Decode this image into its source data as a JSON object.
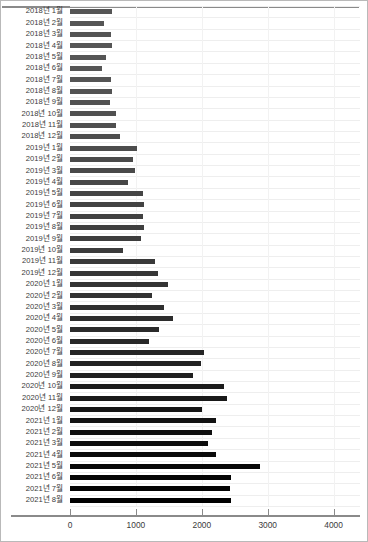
{
  "chart_data": {
    "type": "bar",
    "orientation": "horizontal",
    "title": "",
    "subtitle": "",
    "xlabel": "",
    "ylabel": "",
    "xlim": [
      0,
      4400
    ],
    "ylim": null,
    "grid": true,
    "legend": null,
    "legend_position": "none",
    "xticks": [
      0,
      1000,
      2000,
      3000,
      4000
    ],
    "xticklabels": [
      "0",
      "1000",
      "2000",
      "3000",
      "4000"
    ],
    "categories": [
      "2018년 1월",
      "2018년 2월",
      "2018년 3월",
      "2018년 4월",
      "2018년 5월",
      "2018년 6월",
      "2018년 7월",
      "2018년 8월",
      "2018년 9월",
      "2018년 10월",
      "2018년 11월",
      "2018년 12월",
      "2019년 1월",
      "2019년 2월",
      "2019년 3월",
      "2019년 4월",
      "2019년 5월",
      "2019년 6월",
      "2019년 7월",
      "2019년 8월",
      "2019년 9월",
      "2019년 10월",
      "2019년 11월",
      "2019년 12월",
      "2020년 1월",
      "2020년 2월",
      "2020년 3월",
      "2020년 4월",
      "2020년 5월",
      "2020년 6월",
      "2020년 7월",
      "2020년 8월",
      "2020년 9월",
      "2020년 10월",
      "2020년 11월",
      "2020년 12월",
      "2021년 1월",
      "2021년 2월",
      "2021년 3월",
      "2021년 4월",
      "2021년 5월",
      "2021년 6월",
      "2021년 7월",
      "2021년 8월"
    ],
    "values": [
      640,
      520,
      620,
      640,
      540,
      480,
      620,
      630,
      600,
      700,
      700,
      760,
      1010,
      950,
      990,
      880,
      1100,
      1120,
      1110,
      1120,
      1080,
      800,
      1290,
      1340,
      1490,
      1250,
      1420,
      1560,
      1350,
      1200,
      2030,
      1990,
      1870,
      2330,
      2380,
      2010,
      2220,
      2150,
      2100,
      2210,
      2880,
      2440,
      2430,
      2440
    ],
    "bar_colors": [
      "#555555",
      "#555555",
      "#555555",
      "#555555",
      "#555555",
      "#555555",
      "#545454",
      "#535353",
      "#525252",
      "#515151",
      "#4f4f4f",
      "#4e4e4e",
      "#4c4c4c",
      "#4a4a4a",
      "#494949",
      "#474747",
      "#454545",
      "#434343",
      "#414141",
      "#3f3f3f",
      "#3d3d3d",
      "#3b3b3b",
      "#393939",
      "#363636",
      "#343434",
      "#323232",
      "#2f2f2f",
      "#2d2d2d",
      "#2a2a2a",
      "#282828",
      "#252525",
      "#222222",
      "#1f1f1f",
      "#1c1c1c",
      "#191919",
      "#161616",
      "#131313",
      "#101010",
      "#0d0d0d",
      "#0a0a0a",
      "#070707",
      "#050505",
      "#030303",
      "#000000"
    ]
  },
  "style": {
    "grid_color": "#eeeeee",
    "axis_color": "#8a8a8a",
    "tick_label_color": "#3b3b3b",
    "border_color": "#b9b9b9",
    "background": "#ffffff"
  }
}
